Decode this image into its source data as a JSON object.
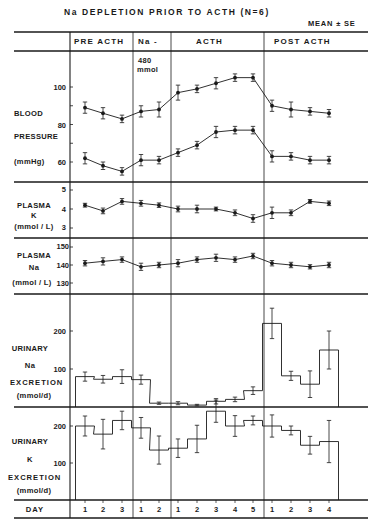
{
  "title": "Na   DEPLETION   PRIOR   TO   ACTH   (N=6)",
  "subtitle": "MEAN ± SE",
  "phases": [
    {
      "label": "PRE   ACTH",
      "days": [
        "1",
        "2",
        "3"
      ]
    },
    {
      "label": "Na -",
      "sub": [
        "480",
        "mmol"
      ],
      "days": [
        "1",
        "2"
      ]
    },
    {
      "label": "ACTH",
      "days": [
        "1",
        "2",
        "3",
        "4",
        "5"
      ]
    },
    {
      "label": "POST   ACTH",
      "days": [
        "1",
        "2",
        "3",
        "4"
      ]
    }
  ],
  "day_label": "DAY",
  "panels": {
    "bp": {
      "label": [
        "BLOOD",
        "PRESSURE",
        "(mmHg)"
      ],
      "ticks": [
        "100",
        "80",
        "60"
      ]
    },
    "pk": {
      "label": [
        "PLASMA",
        "K",
        "(mmol / L)"
      ],
      "ticks": [
        "5",
        "4",
        "3"
      ]
    },
    "pna": {
      "label": [
        "PLASMA",
        "Na",
        "(mmol / L)"
      ],
      "ticks": [
        "150",
        "140",
        "130"
      ]
    },
    "una": {
      "label": [
        "URINARY",
        "Na",
        "EXCRETION",
        "(mmol/d)"
      ],
      "ticks": [
        "200",
        "100"
      ]
    },
    "uk": {
      "label": [
        "URINARY",
        "K",
        "EXCRETION",
        "(mmol/d)"
      ],
      "ticks": [
        "200",
        "100"
      ]
    }
  },
  "chart_data": [
    {
      "type": "line",
      "title": "Blood Pressure (mmHg)",
      "ylabel": "BLOOD PRESSURE (mmHg)",
      "categories": [
        "PRE 1",
        "PRE 2",
        "PRE 3",
        "Na- 1",
        "Na- 2",
        "ACTH 1",
        "ACTH 2",
        "ACTH 3",
        "ACTH 4",
        "ACTH 5",
        "POST 1",
        "POST 2",
        "POST 3",
        "POST 4"
      ],
      "series": [
        {
          "name": "Systolic",
          "values": [
            89,
            86,
            83,
            87,
            88,
            97,
            99,
            102,
            105,
            105,
            90,
            88,
            87,
            86
          ],
          "se": [
            3,
            3,
            2,
            3,
            4,
            4,
            2,
            3,
            2,
            2,
            3,
            4,
            2,
            2
          ]
        },
        {
          "name": "Diastolic",
          "values": [
            62,
            58,
            55,
            61,
            61,
            65,
            69,
            76,
            77,
            77,
            63,
            63,
            61,
            61
          ],
          "se": [
            3,
            2,
            2,
            3,
            2,
            2,
            2,
            3,
            2,
            2,
            3,
            2,
            2,
            2
          ]
        }
      ],
      "ylim": [
        52,
        112
      ]
    },
    {
      "type": "line",
      "title": "Plasma K (mmol/L)",
      "categories": [
        "PRE 1",
        "PRE 2",
        "PRE 3",
        "Na- 1",
        "Na- 2",
        "ACTH 1",
        "ACTH 2",
        "ACTH 3",
        "ACTH 4",
        "ACTH 5",
        "POST 1",
        "POST 2",
        "POST 3",
        "POST 4"
      ],
      "series": [
        {
          "name": "Plasma K",
          "values": [
            4.2,
            3.9,
            4.4,
            4.3,
            4.2,
            4.0,
            4.0,
            4.0,
            3.8,
            3.5,
            3.8,
            3.8,
            4.4,
            4.3
          ],
          "se": [
            0.1,
            0.15,
            0.15,
            0.15,
            0.12,
            0.15,
            0.2,
            0.1,
            0.15,
            0.2,
            0.3,
            0.15,
            0.1,
            0.12
          ]
        }
      ],
      "ylim": [
        2.8,
        5.2
      ]
    },
    {
      "type": "line",
      "title": "Plasma Na (mmol/L)",
      "categories": [
        "PRE 1",
        "PRE 2",
        "PRE 3",
        "Na- 1",
        "Na- 2",
        "ACTH 1",
        "ACTH 2",
        "ACTH 3",
        "ACTH 4",
        "ACTH 5",
        "POST 1",
        "POST 2",
        "POST 3",
        "POST 4"
      ],
      "series": [
        {
          "name": "Plasma Na",
          "values": [
            141,
            142,
            143,
            139,
            140,
            141,
            143,
            144,
            143,
            145,
            141,
            140,
            139,
            140
          ],
          "se": [
            1.5,
            2,
            1.5,
            2,
            1.5,
            2,
            1.5,
            2,
            1.5,
            1.5,
            1.5,
            1.5,
            1.2,
            1.5
          ]
        }
      ],
      "ylim": [
        128,
        151
      ]
    },
    {
      "type": "bar",
      "title": "Urinary Na Excretion (mmol/d)",
      "categories": [
        "PRE 1",
        "PRE 2",
        "PRE 3",
        "Na- 1",
        "Na- 2",
        "ACTH 1",
        "ACTH 2",
        "ACTH 3",
        "ACTH 4",
        "ACTH 5",
        "POST 1",
        "POST 2",
        "POST 3",
        "POST 4"
      ],
      "series": [
        {
          "name": "Urinary Na",
          "values": [
            80,
            73,
            80,
            72,
            10,
            10,
            5,
            15,
            20,
            43,
            220,
            82,
            60,
            150
          ],
          "se": [
            12,
            10,
            18,
            12,
            3,
            4,
            2,
            7,
            6,
            10,
            40,
            12,
            35,
            50
          ]
        }
      ],
      "ylim": [
        0,
        270
      ]
    },
    {
      "type": "bar",
      "title": "Urinary K Excretion (mmol/d)",
      "categories": [
        "PRE 1",
        "PRE 2",
        "PRE 3",
        "Na- 1",
        "Na- 2",
        "ACTH 1",
        "ACTH 2",
        "ACTH 3",
        "ACTH 4",
        "ACTH 5",
        "POST 1",
        "POST 2",
        "POST 3",
        "POST 4"
      ],
      "series": [
        {
          "name": "Urinary K",
          "values": [
            200,
            178,
            215,
            195,
            135,
            140,
            165,
            240,
            200,
            215,
            200,
            188,
            148,
            158
          ],
          "se": [
            27,
            40,
            25,
            28,
            38,
            25,
            37,
            30,
            28,
            12,
            30,
            12,
            24,
            57
          ]
        }
      ],
      "ylim": [
        0,
        250
      ]
    }
  ]
}
